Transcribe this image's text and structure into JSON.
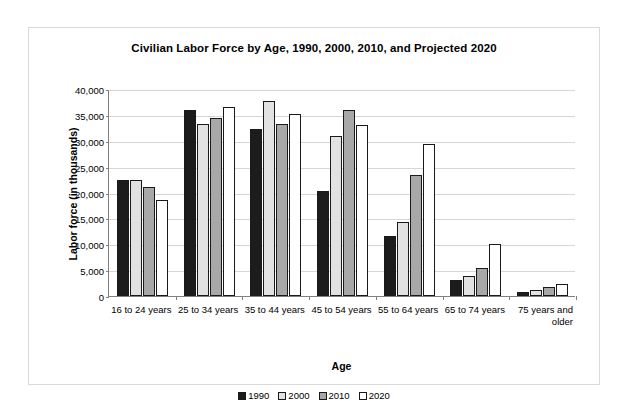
{
  "chart_data": {
    "type": "bar",
    "title": "Civilian Labor Force by Age, 1990, 2000, 2010, and Projected 2020",
    "xlabel": "Age",
    "ylabel": "Labor force (in thousands)",
    "ylim": [
      0,
      40000
    ],
    "ytick_step": 5000,
    "ytick_labels": [
      "40,000",
      "35,000",
      "30,000",
      "25,000",
      "20,000",
      "15,000",
      "10,000",
      "5,000",
      "0"
    ],
    "ytick_values": [
      40000,
      35000,
      30000,
      25000,
      20000,
      15000,
      10000,
      5000,
      0
    ],
    "grid": true,
    "legend_position": "bottom",
    "categories": [
      "16 to 24 years",
      "25 to 34 years",
      "35 to 44 years",
      "45 to 54 years",
      "55 to 64 years",
      "65 to 74 years",
      "75 years and older"
    ],
    "series": [
      {
        "name": "1990",
        "color": "#1c1c1c",
        "values": [
          22500,
          36000,
          32300,
          20300,
          11600,
          3000,
          800
        ]
      },
      {
        "name": "2000",
        "color": "#e2e2e2",
        "values": [
          22500,
          33300,
          37600,
          31000,
          14300,
          3900,
          1200
        ]
      },
      {
        "name": "2010",
        "color": "#a8a8a8",
        "values": [
          21000,
          34400,
          33300,
          36000,
          23400,
          5400,
          1700
        ]
      },
      {
        "name": "2020",
        "color": "#ffffff",
        "values": [
          18500,
          36500,
          35200,
          33000,
          29400,
          10100,
          2400
        ]
      }
    ]
  }
}
